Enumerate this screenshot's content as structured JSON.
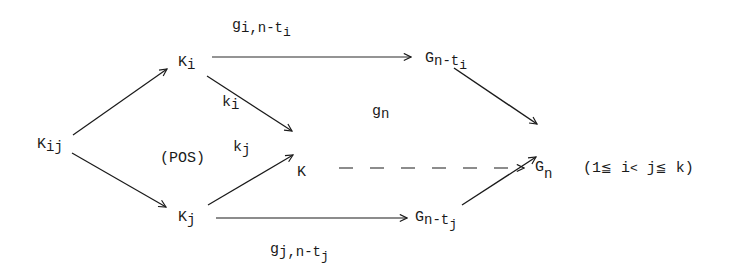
{
  "diagram": {
    "type": "commutative-diagram",
    "nodes": {
      "K_ij": {
        "base": "K",
        "sub": "ij"
      },
      "K_i": {
        "base": "K",
        "sub": "i"
      },
      "K_j": {
        "base": "K",
        "sub": "j"
      },
      "K": {
        "base": "K"
      },
      "G_n_ti": {
        "base": "G",
        "sub": "n-t",
        "subsub": "i"
      },
      "G_n_tj": {
        "base": "G",
        "sub": "n-t",
        "subsub": "j"
      },
      "G_n": {
        "base": "G",
        "sub": "n"
      }
    },
    "edge_labels": {
      "g_i": {
        "base": "g",
        "sub": "i,n-t",
        "subsub": "i"
      },
      "g_j": {
        "base": "g",
        "sub": "j,n-t",
        "subsub": "j"
      },
      "k_i": {
        "base": "k",
        "sub": "i"
      },
      "k_j": {
        "base": "k",
        "sub": "j"
      },
      "g_n": {
        "base": "g",
        "sub": "n"
      }
    },
    "region_label": "(POS)",
    "condition": {
      "open": "(1",
      "le1": "≦",
      "i": " i",
      "lt": "<",
      "j": " j",
      "le2": "≦",
      "close": " k)"
    },
    "edges": [
      {
        "from": "K_ij",
        "to": "K_i",
        "style": "solid"
      },
      {
        "from": "K_ij",
        "to": "K_j",
        "style": "solid"
      },
      {
        "from": "K_i",
        "to": "K",
        "label": "k_i",
        "style": "solid"
      },
      {
        "from": "K_j",
        "to": "K",
        "label": "k_j",
        "style": "solid"
      },
      {
        "from": "K_i",
        "to": "G_n-t_i",
        "label": "g_i,n-t_i",
        "style": "solid"
      },
      {
        "from": "K_j",
        "to": "G_n-t_j",
        "label": "g_j,n-t_j",
        "style": "solid"
      },
      {
        "from": "G_n-t_i",
        "to": "G_n",
        "style": "solid"
      },
      {
        "from": "G_n-t_j",
        "to": "G_n",
        "style": "solid"
      },
      {
        "from": "K",
        "to": "G_n",
        "label": "g_n",
        "style": "dashed"
      }
    ]
  }
}
